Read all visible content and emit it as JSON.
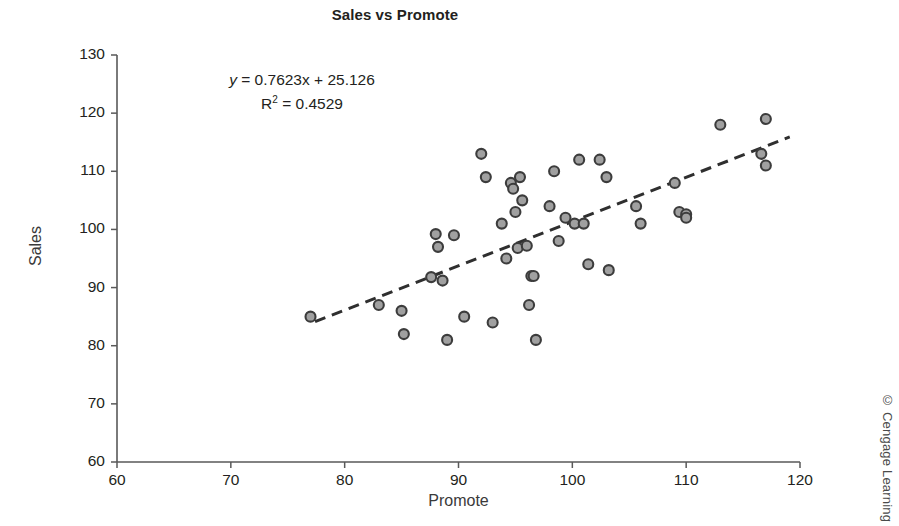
{
  "chart_data": {
    "type": "scatter",
    "title": "Sales vs Promote",
    "xlabel": "Promote",
    "ylabel": "Sales",
    "xlim": [
      60,
      120
    ],
    "ylim": [
      60,
      130
    ],
    "xticks": [
      60,
      70,
      80,
      90,
      100,
      110,
      120
    ],
    "yticks": [
      60,
      70,
      80,
      90,
      100,
      110,
      120,
      130
    ],
    "grid": false,
    "legend": null,
    "annotations": {
      "equation": "y = 0.7623x + 25.126",
      "equation_y_var": "y",
      "equation_rest": " = 0.7623x + 25.126",
      "r_squared_label": "R",
      "r_squared_exp": "2",
      "r_squared_value": " = 0.4529",
      "r_squared_full": "R2 = 0.4529"
    },
    "trendline": {
      "type": "linear",
      "slope": 0.7623,
      "intercept": 25.126,
      "r_squared": 0.4529,
      "style": "dashed",
      "x_start": 77.4,
      "x_end": 119.1,
      "y_start": 84.1,
      "y_end": 115.9
    },
    "marker": {
      "shape": "circle",
      "fill": "#a0a0a0",
      "edge": "#3c3c3c",
      "size": 5
    },
    "series": [
      {
        "name": "Sales vs Promote",
        "points": [
          [
            77.0,
            85.0
          ],
          [
            83.0,
            87.0
          ],
          [
            85.0,
            86.0
          ],
          [
            85.2,
            82.0
          ],
          [
            87.6,
            91.8
          ],
          [
            88.0,
            99.2
          ],
          [
            88.2,
            97.0
          ],
          [
            88.6,
            91.2
          ],
          [
            89.0,
            81.0
          ],
          [
            89.6,
            99.0
          ],
          [
            90.5,
            85.0
          ],
          [
            92.0,
            113.0
          ],
          [
            92.4,
            109.0
          ],
          [
            93.0,
            84.0
          ],
          [
            93.8,
            101.0
          ],
          [
            94.2,
            95.0
          ],
          [
            94.6,
            108.0
          ],
          [
            94.8,
            107.0
          ],
          [
            95.0,
            103.0
          ],
          [
            95.2,
            96.8
          ],
          [
            95.4,
            109.0
          ],
          [
            95.6,
            105.0
          ],
          [
            96.0,
            97.2
          ],
          [
            96.2,
            87.0
          ],
          [
            96.4,
            92.0
          ],
          [
            96.6,
            92.0
          ],
          [
            96.8,
            81.0
          ],
          [
            98.0,
            104.0
          ],
          [
            98.4,
            110.0
          ],
          [
            98.8,
            98.0
          ],
          [
            99.4,
            102.0
          ],
          [
            100.2,
            101.0
          ],
          [
            100.6,
            112.0
          ],
          [
            101.0,
            101.0
          ],
          [
            101.4,
            94.0
          ],
          [
            102.4,
            112.0
          ],
          [
            103.0,
            109.0
          ],
          [
            103.2,
            93.0
          ],
          [
            105.6,
            104.0
          ],
          [
            106.0,
            101.0
          ],
          [
            109.0,
            108.0
          ],
          [
            109.4,
            103.0
          ],
          [
            110.0,
            102.6
          ],
          [
            110.0,
            102.0
          ],
          [
            113.0,
            118.0
          ],
          [
            116.6,
            113.0
          ],
          [
            117.0,
            119.0
          ],
          [
            117.0,
            111.0
          ]
        ]
      }
    ]
  },
  "footer": {
    "copyright": "© Cengage Learning"
  }
}
